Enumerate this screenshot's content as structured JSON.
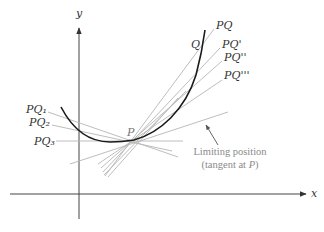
{
  "figure": {
    "axes": {
      "x_label": "x",
      "y_label": "y",
      "color": "#444444"
    },
    "curve": {
      "color": "#1a1a1a",
      "description": "convex curve through P and Q"
    },
    "point_p": {
      "label": "P"
    },
    "point_q": {
      "label": "Q"
    },
    "secant_lines_right": [
      {
        "label": "PQ"
      },
      {
        "label": "PQ'"
      },
      {
        "label": "PQ''"
      },
      {
        "label": "PQ'''"
      }
    ],
    "secant_lines_left": [
      {
        "label": "PQ₁"
      },
      {
        "label": "PQ₂"
      },
      {
        "label": "PQ₃"
      }
    ],
    "annotation": {
      "line1": "Limiting position",
      "line2_prefix": "(tangent at ",
      "line2_var": "P",
      "line2_suffix": ")"
    },
    "colors": {
      "secant": "#b0b0b0",
      "annotation": "#8a8a8a",
      "labels": "#333333"
    }
  }
}
